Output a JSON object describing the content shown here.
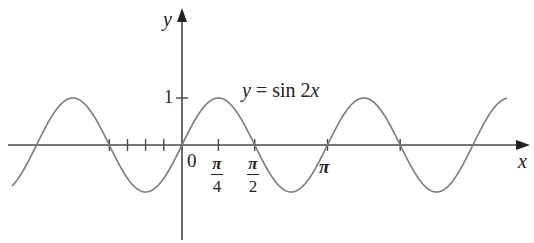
{
  "chart_data": {
    "type": "line",
    "title": "",
    "function": "y = sin 2x",
    "annotation": "y = sin 2x",
    "xlabel": "x",
    "ylabel": "y",
    "x_ticks": [
      {
        "value": -1.5708,
        "label": ""
      },
      {
        "value": -1.1781,
        "label": ""
      },
      {
        "value": -0.7854,
        "label": ""
      },
      {
        "value": -0.3927,
        "label": ""
      },
      {
        "value": 0,
        "label": "0"
      },
      {
        "value": 0.7854,
        "label": "π/4"
      },
      {
        "value": 1.5708,
        "label": "π/2"
      },
      {
        "value": 3.1416,
        "label": "π"
      },
      {
        "value": 4.7124,
        "label": ""
      }
    ],
    "y_ticks": [
      {
        "value": 1,
        "label": "1"
      }
    ],
    "xlim": [
      -1.25,
      2.23
    ],
    "ylim": [
      -2.1,
      2.8
    ],
    "series": [
      {
        "name": "sin 2x",
        "x_range_pi": [
          -1.17,
          2.23
        ],
        "x": [
          -3.69,
          -3.14,
          -2.36,
          -1.57,
          -0.79,
          0,
          0.79,
          1.57,
          2.36,
          3.14,
          3.93,
          4.71,
          5.5,
          7.0
        ],
        "values": [
          -0.89,
          0,
          1,
          0,
          -1,
          0,
          1,
          0,
          -1,
          0,
          1,
          0,
          -1,
          0.99
        ]
      }
    ],
    "grid": false,
    "legend": false
  },
  "labels": {
    "y_axis": "y",
    "x_axis": "x",
    "one": "1",
    "zero": "0",
    "pi_num": "π",
    "four": "4",
    "two": "2",
    "pi": "π",
    "equation_y": "y",
    "equation_eq": " = sin 2",
    "equation_x": "x"
  },
  "colors": {
    "curve": "#7a7a7a",
    "axis": "#4a4a4a",
    "text": "#222222"
  },
  "layout": {
    "origin_px": [
      182,
      145
    ],
    "px_per_unit_x": 46.3,
    "px_per_unit_y": 47
  }
}
